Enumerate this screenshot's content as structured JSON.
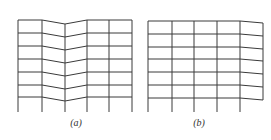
{
  "figure": {
    "panels": [
      {
        "id": "a",
        "caption": "(a)",
        "description": "Frame grid with V-shaped downward kink at the central column",
        "columns_x": [
          18,
          42,
          65,
          87,
          109,
          132
        ],
        "floors_y": [
          20,
          33,
          46,
          59,
          72,
          85,
          97
        ],
        "kink_column_index": 2,
        "kink_depth": 4,
        "base_y": 112,
        "caption_x": 76,
        "caption_y": 117
      },
      {
        "id": "b",
        "caption": "(b)",
        "description": "Frame grid with rightmost bay sloping and unsupported right edge",
        "columns_x": [
          148,
          172,
          194,
          217,
          240,
          263
        ],
        "floors_y": [
          21,
          34,
          47,
          59,
          72,
          85,
          98
        ],
        "right_edge_drop": 2,
        "base_y": 112,
        "caption_x": 199,
        "caption_y": 117
      }
    ],
    "line_color": "#3a3a3a"
  }
}
